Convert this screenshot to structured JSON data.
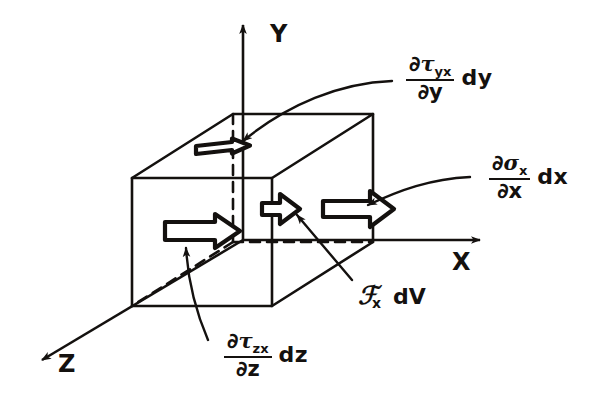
{
  "figure": {
    "kind": "stress-element-free-body-diagram"
  },
  "axes": {
    "y": {
      "label": "Y",
      "direction": "up"
    },
    "x": {
      "label": "X",
      "direction": "right"
    },
    "z": {
      "label": "Z",
      "direction": "down-left"
    }
  },
  "labels": {
    "tau_yx": {
      "numerator_partial": "∂",
      "numerator_symbol": "τ",
      "numerator_sub": "yx",
      "denominator_partial": "∂",
      "denominator_var": "y",
      "differential": "dy"
    },
    "sigma_x": {
      "numerator_partial": "∂",
      "numerator_symbol": "σ",
      "numerator_sub": "x",
      "denominator_partial": "∂",
      "denominator_var": "x",
      "differential": "dx"
    },
    "tau_zx": {
      "numerator_partial": "∂",
      "numerator_symbol": "τ",
      "numerator_sub": "zx",
      "denominator_partial": "∂",
      "denominator_var": "z",
      "differential": "dz"
    },
    "body_force": {
      "symbol": "ℱ",
      "sub": "x",
      "differential": "dV"
    }
  },
  "colors": {
    "ink": "#14110f",
    "background": "#ffffff"
  },
  "arrows": [
    {
      "name": "top-face-shear-arrow",
      "face": "top",
      "component": "tau_yx"
    },
    {
      "name": "front-face-shear-arrow",
      "face": "front-left",
      "component": "tau_zx"
    },
    {
      "name": "center-body-force-arrow",
      "face": "center",
      "component": "body_force"
    },
    {
      "name": "right-face-normal-arrow",
      "face": "right",
      "component": "sigma_x"
    }
  ]
}
